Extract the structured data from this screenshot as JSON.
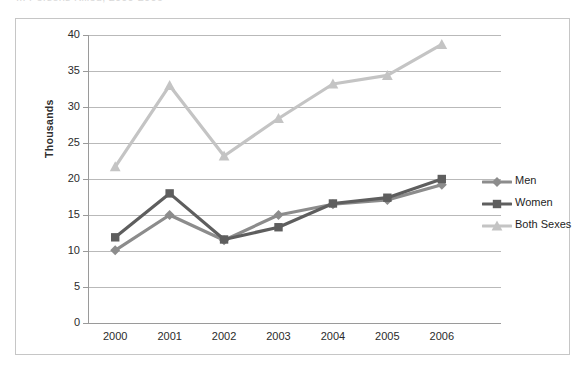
{
  "title": "...  Persons Killed, 2000-2006",
  "axis": {
    "y_title": "Thousands",
    "y_ticks": [
      "40",
      "35",
      "30",
      "25",
      "20",
      "15",
      "10",
      "5",
      "0"
    ],
    "x_ticks": [
      "2000",
      "2001",
      "2002",
      "2003",
      "2004",
      "2005",
      "2006"
    ]
  },
  "legend": {
    "position": "right",
    "items": [
      {
        "label": "Men",
        "color": "#8c8c8c",
        "marker": "diamond"
      },
      {
        "label": "Women",
        "color": "#5e5e5e",
        "marker": "square"
      },
      {
        "label": "Both Sexes",
        "color": "#c4c4c4",
        "marker": "triangle"
      }
    ]
  },
  "colors": {
    "men": "#8c8c8c",
    "women": "#5e5e5e",
    "both": "#c4c4c4",
    "gridline": "#b9b9b9",
    "axis": "#9a9a9a",
    "frame": "#c6c6c6",
    "text": "#2b2b2b"
  },
  "chart_data": {
    "type": "line",
    "title": "...  Persons Killed, 2000-2006",
    "xlabel": "",
    "ylabel": "Thousands",
    "ylim": [
      0,
      40
    ],
    "ytick_step": 5,
    "grid": true,
    "legend_position": "right",
    "categories": [
      "2000",
      "2001",
      "2002",
      "2003",
      "2004",
      "2005",
      "2006"
    ],
    "series": [
      {
        "name": "Men",
        "marker": "diamond",
        "color": "#8c8c8c",
        "values": [
          10.1,
          15.0,
          11.5,
          15.0,
          16.5,
          17.1,
          19.2
        ]
      },
      {
        "name": "Women",
        "marker": "square",
        "color": "#5e5e5e",
        "values": [
          11.9,
          18.0,
          11.6,
          13.3,
          16.6,
          17.4,
          20.0
        ]
      },
      {
        "name": "Both Sexes",
        "marker": "triangle",
        "color": "#c4c4c4",
        "values": [
          21.7,
          33.0,
          23.2,
          28.4,
          33.2,
          34.4,
          38.7
        ]
      }
    ]
  }
}
